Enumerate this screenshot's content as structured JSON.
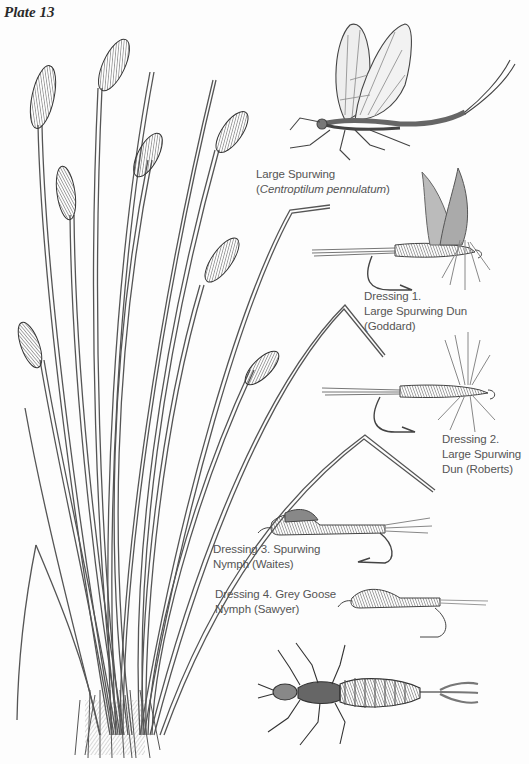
{
  "plate": {
    "title": "Plate 13",
    "background": "#fdfdfd",
    "ink_color": "#4a4a4a"
  },
  "illustrations": [
    {
      "id": "sedge-plant",
      "subject": "sedge grass with flower spikes"
    },
    {
      "id": "adult-mayfly",
      "subject": "Large Spurwing adult"
    },
    {
      "id": "dressing-1-fly",
      "subject": "dry fly with upright wings"
    },
    {
      "id": "dressing-2-fly",
      "subject": "dry fly with hackle"
    },
    {
      "id": "dressing-3-fly",
      "subject": "nymph fly"
    },
    {
      "id": "dressing-4-fly",
      "subject": "nymph fly"
    },
    {
      "id": "nymph-insect",
      "subject": "mayfly nymph"
    }
  ],
  "labels": {
    "species": {
      "common_name": "Large Spurwing",
      "latin_open": "(",
      "latin_name": "Centroptilum pennulatum",
      "latin_close": ")"
    },
    "dressing1": {
      "line1": "Dressing 1.",
      "line2": "Large Spurwing Dun",
      "line3": "(Goddard)"
    },
    "dressing2": {
      "line1": "Dressing 2.",
      "line2": "Large Spurwing",
      "line3": "Dun (Roberts)"
    },
    "dressing3": {
      "line1": "Dressing 3. Spurwing",
      "line2": "Nymph (Waites)"
    },
    "dressing4": {
      "line1": "Dressing 4. Grey Goose",
      "line2": "Nymph (Sawyer)"
    }
  }
}
